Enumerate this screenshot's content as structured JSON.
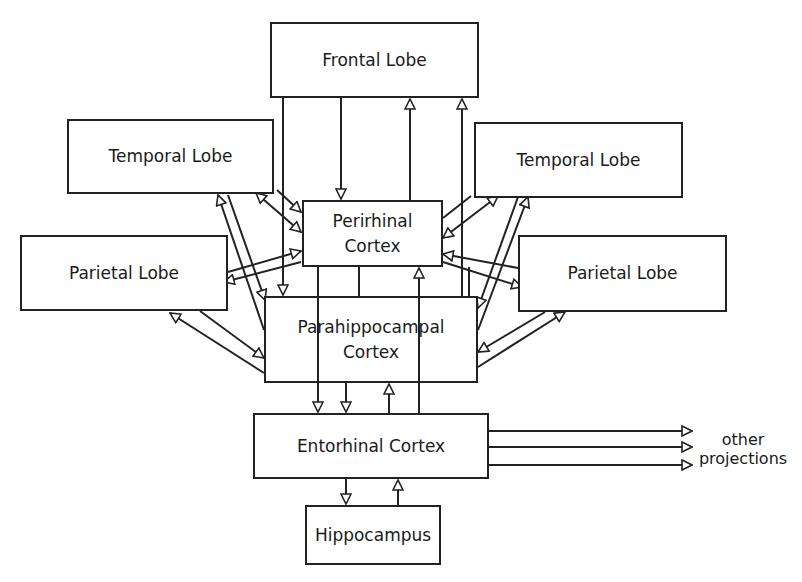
{
  "diagram": {
    "nodes": {
      "frontal": {
        "label": "Frontal Lobe",
        "x": 270,
        "y": 22,
        "w": 209,
        "h": 76
      },
      "temporal_left": {
        "label": "Temporal Lobe",
        "x": 67,
        "y": 119,
        "w": 207,
        "h": 75
      },
      "temporal_right": {
        "label": "Temporal Lobe",
        "x": 474,
        "y": 122,
        "w": 209,
        "h": 76
      },
      "parietal_left": {
        "label": "Parietal Lobe",
        "x": 20,
        "y": 235,
        "w": 208,
        "h": 76
      },
      "parietal_right": {
        "label": "Parietal Lobe",
        "x": 518,
        "y": 235,
        "w": 209,
        "h": 77
      },
      "perirhinal": {
        "label": "Perirhinal\nCortex",
        "x": 302,
        "y": 200,
        "w": 141,
        "h": 67
      },
      "parahippocampal": {
        "label": "Parahippocampal\nCortex",
        "x": 264,
        "y": 296,
        "w": 214,
        "h": 87
      },
      "entorhinal": {
        "label": "Entorhinal Cortex",
        "x": 253,
        "y": 413,
        "w": 236,
        "h": 66
      },
      "hippocampus": {
        "label": "Hippocampus",
        "x": 305,
        "y": 505,
        "w": 136,
        "h": 60
      }
    },
    "other_projections_label": "other\nprojections",
    "line_color": "#222222",
    "background": "#ffffff"
  }
}
